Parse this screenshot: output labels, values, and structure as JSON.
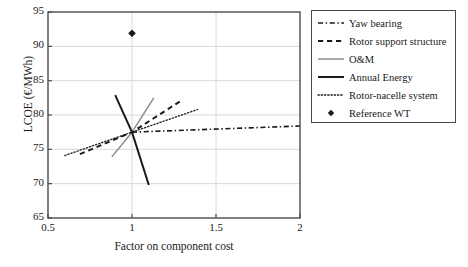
{
  "chart_data": {
    "type": "line",
    "title": "",
    "xlabel": "Factor on component cost",
    "ylabel": "LCOE (€/MWh)",
    "xlim": [
      0.5,
      2
    ],
    "ylim": [
      65,
      95
    ],
    "xticks": [
      "0.5",
      "1",
      "1.5",
      "2"
    ],
    "xtick_values": [
      0.5,
      1,
      1.5,
      2
    ],
    "yticks": [
      "65",
      "70",
      "75",
      "80",
      "85",
      "90",
      "95"
    ],
    "ytick_values": [
      65,
      70,
      75,
      80,
      85,
      90,
      95
    ],
    "grid": true,
    "legend_position": "right-outside",
    "baseline_point": [
      1.0,
      77.5
    ],
    "series": [
      {
        "name": "Yaw bearing",
        "style": "dashdot",
        "color": "#1a1a1a",
        "width": 1.6,
        "x": [
          1.0,
          2.0
        ],
        "y": [
          77.5,
          78.4
        ]
      },
      {
        "name": "Rotor support structure",
        "style": "dashed",
        "color": "#1a1a1a",
        "width": 2.0,
        "x": [
          0.69,
          1.0,
          1.3
        ],
        "y": [
          74.3,
          77.5,
          82.2
        ]
      },
      {
        "name": "O&M",
        "style": "solid",
        "color": "#8c8c8c",
        "width": 1.5,
        "x": [
          0.88,
          1.0,
          1.13
        ],
        "y": [
          73.9,
          77.5,
          82.5
        ]
      },
      {
        "name": "Annual Energy",
        "style": "solid",
        "color": "#1a1a1a",
        "width": 2.0,
        "x": [
          0.9,
          1.0,
          1.1
        ],
        "y": [
          82.9,
          77.5,
          69.8
        ]
      },
      {
        "name": "Rotor-nacelle system",
        "style": "dotted",
        "color": "#1a1a1a",
        "width": 1.3,
        "x": [
          0.6,
          1.0,
          1.39
        ],
        "y": [
          74.1,
          77.5,
          80.8
        ]
      },
      {
        "name": "Reference WT",
        "style": "marker",
        "marker": "diamond",
        "color": "#1a1a1a",
        "x": [
          1.0
        ],
        "y": [
          91.9
        ]
      }
    ]
  },
  "legend": {
    "items": [
      {
        "label": "Yaw bearing",
        "key": "dashdot-line-key"
      },
      {
        "label": "Rotor support structure",
        "key": "dashed-line-key"
      },
      {
        "label": "O&M",
        "key": "thin-gray-line-key"
      },
      {
        "label": "Annual Energy",
        "key": "thick-black-line-key"
      },
      {
        "label": "Rotor-nacelle system",
        "key": "dotted-line-key"
      },
      {
        "label": "Reference WT",
        "key": "diamond-marker-key"
      }
    ]
  },
  "colors": {
    "axis": "#4a4a4a",
    "grid": "#d8d8d8",
    "line_black": "#1a1a1a",
    "line_gray": "#8c8c8c",
    "background": "#ffffff"
  }
}
